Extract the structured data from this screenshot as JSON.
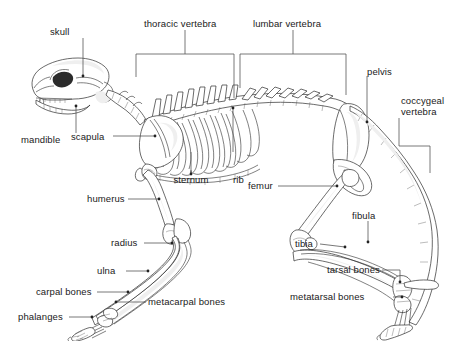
{
  "figure": {
    "background_color": "#ffffff",
    "line_color": "#2b2b2b",
    "leader_color": "#555555",
    "text_color": "#1a1a1a",
    "width": 475,
    "height": 341
  },
  "labels": {
    "skull": "skull",
    "mandible": "mandible",
    "scapula": "scapula",
    "thoracic_vertebra": "thoracic vertebra",
    "lumbar_vertebra": "lumbar vertebra",
    "pelvis": "pelvis",
    "coccygeal_vertebra_line1": "coccygeal",
    "coccygeal_vertebra_line2": "vertebra",
    "sternum": "sternum",
    "rib": "rib",
    "humerus": "humerus",
    "radius": "radius",
    "ulna": "ulna",
    "carpal_bones": "carpal bones",
    "metacarpal_bones": "metacarpal bones",
    "phalanges": "phalanges",
    "femur": "femur",
    "fibula": "fibula",
    "tibia": "tibia",
    "tarsal_bones": "tarsal bones",
    "metatarsal_bones": "metatarsal bones"
  }
}
